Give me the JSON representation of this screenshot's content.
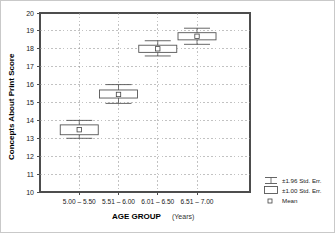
{
  "chart_data": {
    "type": "box",
    "title": "",
    "xlabel_bold": "AGE GROUP",
    "xlabel_sub": "(Years)",
    "ylabel": "Concepts About Print Score",
    "ylim": [
      10,
      20
    ],
    "yticks": [
      10,
      11,
      12,
      13,
      14,
      15,
      16,
      17,
      18,
      19,
      20
    ],
    "ytick_labels": [
      "10",
      "11",
      "12",
      "13",
      "14",
      "15",
      "16",
      "17",
      "18",
      "19",
      "20"
    ],
    "grid": true,
    "grid_style": "dotted",
    "categories": [
      "5.00 – 5.50",
      "5.51 – 6.00",
      "6.01 – 6.50",
      "6.51 – 7.00"
    ],
    "series": [
      {
        "name": "Mean",
        "values": [
          13.48,
          15.45,
          18.0,
          18.7
        ]
      },
      {
        "name": "±1.00 Std. Err.",
        "box_low": [
          13.2,
          15.25,
          17.8,
          18.5
        ],
        "box_high": [
          13.75,
          15.7,
          18.2,
          18.9
        ]
      },
      {
        "name": "±1.96 Std. Err.",
        "whisker_low": [
          13.0,
          14.95,
          17.6,
          18.25
        ],
        "whisker_high": [
          14.0,
          16.0,
          18.45,
          19.15
        ]
      }
    ],
    "legend": {
      "position": "right",
      "entries": [
        {
          "label": "±1.96 Std. Err.",
          "marker": "whisker-icon"
        },
        {
          "label": "±1.00 Std. Err.",
          "marker": "box-icon"
        },
        {
          "label": "Mean",
          "marker": "square-marker-icon"
        }
      ]
    },
    "colors": {
      "axis": "#4d4d4d",
      "grid": "#9a9a9a",
      "box_stroke": "#555555",
      "box_fill": "#ffffff",
      "text": "#1a1a1a"
    }
  }
}
